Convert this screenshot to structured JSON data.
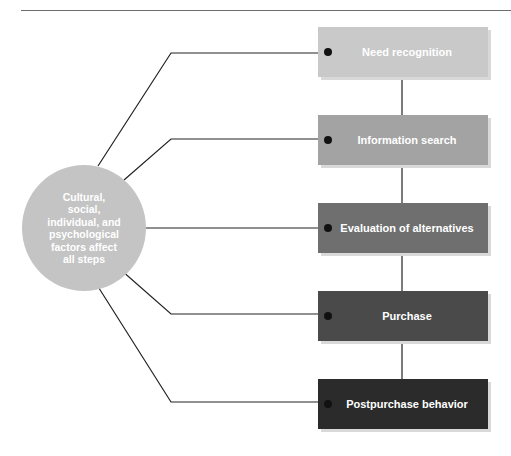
{
  "diagram": {
    "type": "flow-process",
    "center_node": {
      "label": "Cultural,\nsocial,\nindividual, and\npsychological\nfactors affect\nall steps",
      "color": "#c4c4c4"
    },
    "steps": [
      {
        "label": "Need recognition",
        "color": "#c9c9c9"
      },
      {
        "label": "Information search",
        "color": "#a3a3a3"
      },
      {
        "label": "Evaluation of alternatives",
        "color": "#6f6f6f"
      },
      {
        "label": "Purchase",
        "color": "#4a4a4a"
      },
      {
        "label": "Postpurchase behavior",
        "color": "#2b2b2b"
      }
    ],
    "edges": [
      {
        "from": "center_node",
        "to": "steps.0"
      },
      {
        "from": "center_node",
        "to": "steps.1"
      },
      {
        "from": "center_node",
        "to": "steps.2"
      },
      {
        "from": "center_node",
        "to": "steps.3"
      },
      {
        "from": "center_node",
        "to": "steps.4"
      },
      {
        "from": "steps.0",
        "to": "steps.1"
      },
      {
        "from": "steps.1",
        "to": "steps.2"
      },
      {
        "from": "steps.2",
        "to": "steps.3"
      },
      {
        "from": "steps.3",
        "to": "steps.4"
      }
    ]
  }
}
